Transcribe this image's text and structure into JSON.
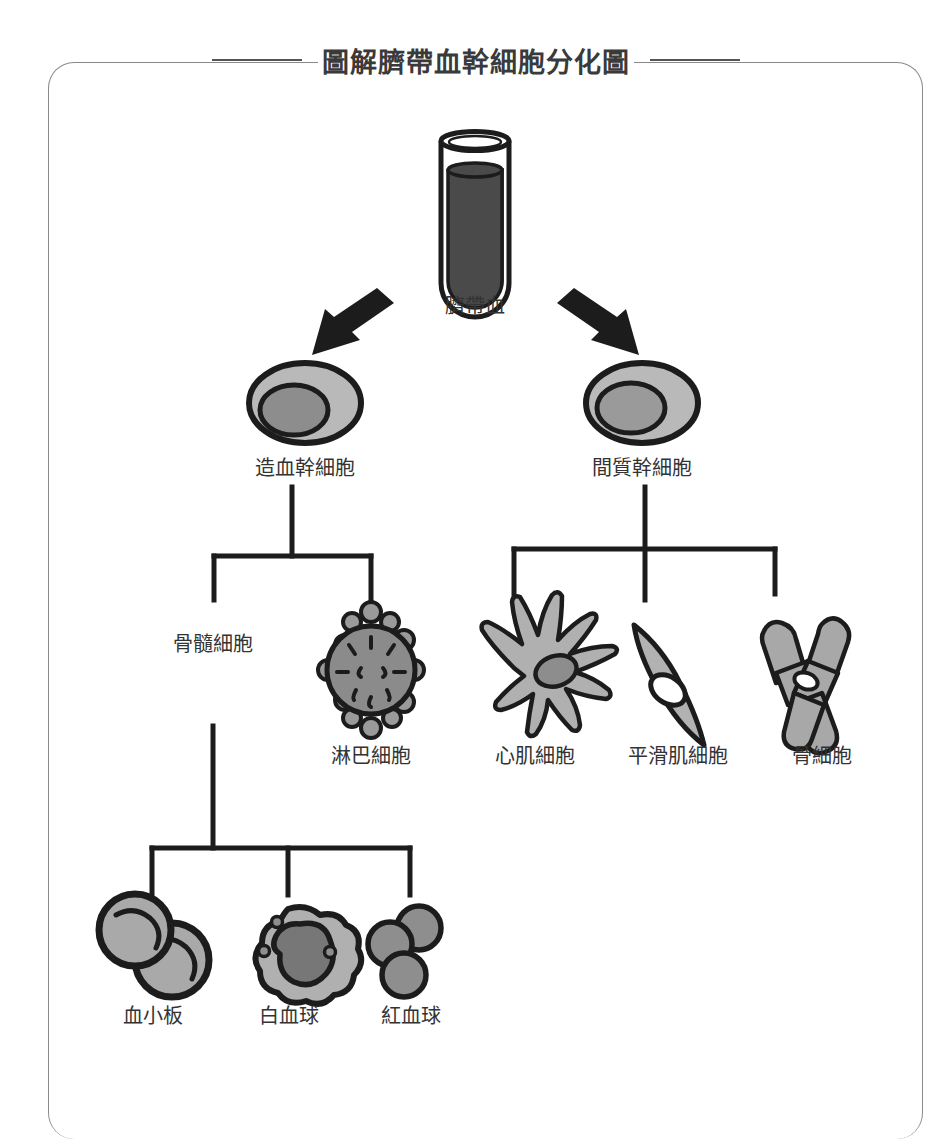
{
  "title": "圖解臍帶血幹細胞分化圖",
  "source": {
    "label": "臍帶血",
    "icon": "test-tube-icon"
  },
  "arrows": [
    {
      "name": "arrow-to-hematopoietic",
      "direction": "down-left"
    },
    {
      "name": "arrow-to-mesenchymal",
      "direction": "down-right"
    }
  ],
  "stem_cells": [
    {
      "id": "hematopoietic",
      "label": "造血幹細胞",
      "icon": "stem-cell-icon"
    },
    {
      "id": "mesenchymal",
      "label": "間質幹細胞",
      "icon": "stem-cell-icon"
    }
  ],
  "level2": [
    {
      "id": "myeloid",
      "label": "骨髓細胞",
      "icon": "text-only",
      "parent": "hematopoietic"
    },
    {
      "id": "lymphocyte",
      "label": "淋巴細胞",
      "icon": "lymphocyte-icon",
      "parent": "hematopoietic"
    },
    {
      "id": "cardiomyocyte",
      "label": "心肌細胞",
      "icon": "cardiomyocyte-icon",
      "parent": "mesenchymal"
    },
    {
      "id": "smooth-muscle",
      "label": "平滑肌細胞",
      "icon": "smooth-muscle-icon",
      "parent": "mesenchymal"
    },
    {
      "id": "osteocyte",
      "label": "骨細胞",
      "icon": "bone-cell-icon",
      "parent": "mesenchymal"
    }
  ],
  "level3": [
    {
      "id": "platelet",
      "label": "血小板",
      "icon": "platelet-icon",
      "parent": "myeloid"
    },
    {
      "id": "leukocyte",
      "label": "白血球",
      "icon": "leukocyte-icon",
      "parent": "myeloid"
    },
    {
      "id": "erythrocyte",
      "label": "紅血球",
      "icon": "erythrocyte-icon",
      "parent": "myeloid"
    }
  ],
  "colors": {
    "outline": "#1c1c1c",
    "cell_light": "#b9b9b9",
    "cell_mid": "#9a9a9a",
    "cell_dark": "#6f6f6f",
    "blood": "#4a4a4a",
    "frame": "#8a8a8a",
    "text": "#333333"
  }
}
